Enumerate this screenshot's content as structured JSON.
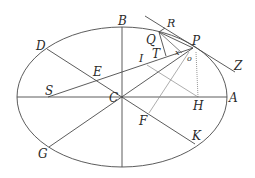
{
  "diagram": {
    "colors": {
      "stroke": "#4a4a4a",
      "light_stroke": "#8a8a8a",
      "label": "#2a2a2a",
      "background": "#ffffff"
    },
    "ellipse": {
      "cx": 122,
      "cy": 97,
      "rx": 105,
      "ry": 70
    },
    "points": {
      "A": {
        "label": "A",
        "x": 227,
        "y": 97
      },
      "B": {
        "label": "B",
        "x": 122,
        "y": 27
      },
      "C": {
        "label": "C",
        "x": 122,
        "y": 97
      },
      "D": {
        "label": "D",
        "x": 47,
        "y": 49
      },
      "E": {
        "label": "E",
        "x": 95,
        "y": 76
      },
      "F": {
        "label": "F",
        "x": 149,
        "y": 113
      },
      "G": {
        "label": "G",
        "x": 49,
        "y": 147
      },
      "H": {
        "label": "H",
        "x": 198,
        "y": 97
      },
      "I": {
        "label": "I",
        "x": 147,
        "y": 65
      },
      "K": {
        "label": "K",
        "x": 195,
        "y": 144
      },
      "P": {
        "label": "P",
        "x": 193,
        "y": 48
      },
      "Q": {
        "label": "Q",
        "x": 159,
        "y": 32
      },
      "R": {
        "label": "R",
        "x": 170,
        "y": 24
      },
      "S": {
        "label": "S",
        "x": 48,
        "y": 97
      },
      "T": {
        "label": "T",
        "x": 166,
        "y": 55
      },
      "x": {
        "label": "x",
        "x": 180,
        "y": 51
      },
      "o": {
        "label": "o",
        "x": 188,
        "y": 56
      },
      "Z": {
        "label": "Z",
        "x": 235,
        "y": 72
      }
    },
    "labels": {
      "A": "A",
      "B": "B",
      "C": "C",
      "D": "D",
      "E": "E",
      "F": "F",
      "G": "G",
      "H": "H",
      "I": "I",
      "K": "K",
      "P": "P",
      "Q": "Q",
      "R": "R",
      "S": "S",
      "T": "T",
      "x": "x",
      "o": "o",
      "Z": "Z"
    }
  }
}
